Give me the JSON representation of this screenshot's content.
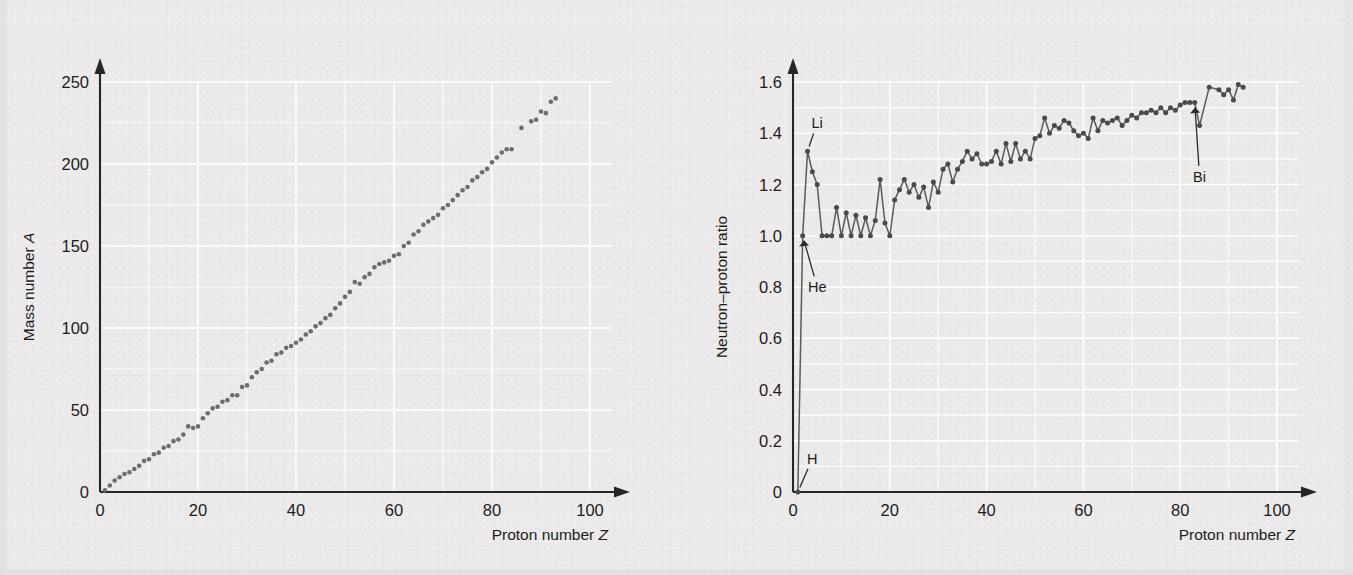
{
  "background_color": "#ebe9e9",
  "grid_color": "#ffffff",
  "axis_color": "#262626",
  "marker_color": "#6d6d6d",
  "line_color": "#5a5a5a",
  "chart_data": [
    {
      "id": "mass-number-vs-proton-number",
      "type": "scatter",
      "title": "",
      "xlabel": "Proton number Z",
      "ylabel": "Mass number A",
      "xlim": [
        0,
        100
      ],
      "ylim": [
        0,
        250
      ],
      "xticks": [
        0,
        20,
        40,
        60,
        80,
        100
      ],
      "xticklabels": [
        "0",
        "20",
        "40",
        "60",
        "80",
        "100"
      ],
      "yticks": [
        0,
        50,
        100,
        150,
        200,
        250
      ],
      "yticklabels": [
        "0",
        "50",
        "100",
        "150",
        "200",
        "250"
      ],
      "x_minor_step": 10,
      "y_minor_step": 25,
      "grid": true,
      "legend": "none",
      "axis_style": "arrow-tipped",
      "x": [
        1,
        2,
        3,
        4,
        5,
        6,
        7,
        8,
        9,
        10,
        11,
        12,
        13,
        14,
        15,
        16,
        17,
        18,
        19,
        20,
        21,
        22,
        23,
        24,
        25,
        26,
        27,
        28,
        29,
        30,
        31,
        32,
        33,
        34,
        35,
        36,
        37,
        38,
        39,
        40,
        41,
        42,
        43,
        44,
        45,
        46,
        47,
        48,
        49,
        50,
        51,
        52,
        53,
        54,
        55,
        56,
        57,
        58,
        59,
        60,
        61,
        62,
        63,
        64,
        65,
        66,
        67,
        68,
        69,
        70,
        71,
        72,
        73,
        74,
        75,
        76,
        77,
        78,
        79,
        80,
        81,
        82,
        83,
        84,
        86,
        88,
        89,
        90,
        91,
        92,
        93
      ],
      "y": [
        1,
        4,
        7,
        9,
        11,
        12,
        14,
        16,
        19,
        20,
        23,
        24,
        27,
        28,
        31,
        32,
        35,
        40,
        39,
        40,
        45,
        48,
        51,
        52,
        55,
        56,
        59,
        59,
        64,
        65,
        70,
        73,
        75,
        79,
        80,
        84,
        85,
        88,
        89,
        91,
        93,
        96,
        98,
        101,
        103,
        106,
        108,
        112,
        115,
        119,
        122,
        128,
        127,
        131,
        133,
        137,
        139,
        140,
        141,
        144,
        145,
        150,
        152,
        157,
        159,
        163,
        165,
        167,
        169,
        173,
        175,
        178,
        181,
        184,
        186,
        190,
        192,
        195,
        197,
        201,
        204,
        207,
        209,
        209,
        222,
        226,
        227,
        232,
        231,
        238,
        240
      ]
    },
    {
      "id": "neutron-proton-ratio-vs-proton-number",
      "type": "line",
      "title": "",
      "xlabel": "Proton number Z",
      "ylabel": "Neutron–proton ratio",
      "xlim": [
        0,
        100
      ],
      "ylim": [
        0,
        1.6
      ],
      "xticks": [
        0,
        20,
        40,
        60,
        80,
        100
      ],
      "xticklabels": [
        "0",
        "20",
        "40",
        "60",
        "80",
        "100"
      ],
      "yticks": [
        0,
        0.2,
        0.4,
        0.6,
        0.8,
        1.0,
        1.2,
        1.4,
        1.6
      ],
      "yticklabels": [
        "0",
        "0.2",
        "0.4",
        "0.6",
        "0.8",
        "1.0",
        "1.2",
        "1.4",
        "1.6"
      ],
      "x_minor_step": 10,
      "y_minor_step": 0.1,
      "grid": true,
      "legend": "none",
      "axis_style": "arrow-tipped",
      "markers": true,
      "x": [
        1,
        2,
        3,
        4,
        5,
        6,
        7,
        8,
        9,
        10,
        11,
        12,
        13,
        14,
        15,
        16,
        17,
        18,
        19,
        20,
        21,
        22,
        23,
        24,
        25,
        26,
        27,
        28,
        29,
        30,
        31,
        32,
        33,
        34,
        35,
        36,
        37,
        38,
        39,
        40,
        41,
        42,
        43,
        44,
        45,
        46,
        47,
        48,
        49,
        50,
        51,
        52,
        53,
        54,
        55,
        56,
        57,
        58,
        59,
        60,
        61,
        62,
        63,
        64,
        65,
        66,
        67,
        68,
        69,
        70,
        71,
        72,
        73,
        74,
        75,
        76,
        77,
        78,
        79,
        80,
        81,
        82,
        83,
        84,
        86,
        88,
        89,
        90,
        91,
        92,
        93
      ],
      "y": [
        0,
        1.0,
        1.33,
        1.25,
        1.2,
        1.0,
        1.0,
        1.0,
        1.11,
        1.0,
        1.09,
        1.0,
        1.08,
        1.0,
        1.07,
        1.0,
        1.06,
        1.22,
        1.05,
        1.0,
        1.14,
        1.18,
        1.22,
        1.17,
        1.2,
        1.15,
        1.19,
        1.11,
        1.21,
        1.17,
        1.26,
        1.28,
        1.21,
        1.26,
        1.29,
        1.33,
        1.3,
        1.32,
        1.28,
        1.28,
        1.29,
        1.33,
        1.28,
        1.36,
        1.29,
        1.36,
        1.3,
        1.33,
        1.3,
        1.38,
        1.39,
        1.46,
        1.4,
        1.43,
        1.42,
        1.45,
        1.44,
        1.41,
        1.39,
        1.4,
        1.38,
        1.46,
        1.41,
        1.45,
        1.44,
        1.45,
        1.46,
        1.43,
        1.45,
        1.47,
        1.46,
        1.48,
        1.48,
        1.49,
        1.48,
        1.5,
        1.48,
        1.5,
        1.49,
        1.51,
        1.52,
        1.52,
        1.52,
        1.43,
        1.58,
        1.57,
        1.55,
        1.57,
        1.53,
        1.59,
        1.58
      ],
      "annotations": [
        {
          "label": "H",
          "point_x": 1,
          "point_y": 0.0,
          "text_x": 4,
          "text_y": 0.13
        },
        {
          "label": "He",
          "point_x": 2,
          "point_y": 1.0,
          "text_x": 5,
          "text_y": 0.8
        },
        {
          "label": "Li",
          "point_x": 3,
          "point_y": 1.33,
          "text_x": 5,
          "text_y": 1.44
        },
        {
          "label": "Bi",
          "point_x": 83,
          "point_y": 1.52,
          "text_x": 84,
          "text_y": 1.23
        }
      ]
    }
  ]
}
